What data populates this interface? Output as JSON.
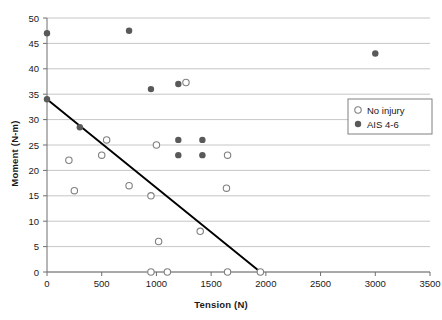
{
  "chart_data": {
    "type": "scatter",
    "title": "",
    "xlabel": "Tension (N)",
    "ylabel": "Moment (N-m)",
    "xlim": [
      0,
      3500
    ],
    "ylim": [
      0,
      50
    ],
    "xticks": [
      0,
      500,
      1000,
      1500,
      2000,
      2500,
      3000,
      3500
    ],
    "yticks": [
      0,
      5,
      10,
      15,
      20,
      25,
      30,
      35,
      40,
      45,
      50
    ],
    "grid": "horizontal",
    "legend_position": "right-upper",
    "series": [
      {
        "name": "No injury",
        "marker": "open-circle",
        "color": "#808080",
        "points": [
          {
            "x": 200,
            "y": 22
          },
          {
            "x": 250,
            "y": 16
          },
          {
            "x": 500,
            "y": 23
          },
          {
            "x": 545,
            "y": 26
          },
          {
            "x": 750,
            "y": 17
          },
          {
            "x": 950,
            "y": 15
          },
          {
            "x": 1000,
            "y": 25
          },
          {
            "x": 1020,
            "y": 6
          },
          {
            "x": 1270,
            "y": 37.3
          },
          {
            "x": 1400,
            "y": 8
          },
          {
            "x": 1640,
            "y": 16.5
          },
          {
            "x": 1650,
            "y": 23
          },
          {
            "x": 950,
            "y": 0
          },
          {
            "x": 1100,
            "y": 0
          },
          {
            "x": 1650,
            "y": 0
          },
          {
            "x": 1950,
            "y": 0
          }
        ]
      },
      {
        "name": "AIS 4-6",
        "marker": "filled-circle",
        "color": "#595959",
        "points": [
          {
            "x": 0,
            "y": 47
          },
          {
            "x": 0,
            "y": 34
          },
          {
            "x": 300,
            "y": 28.5
          },
          {
            "x": 750,
            "y": 47.5
          },
          {
            "x": 950,
            "y": 36
          },
          {
            "x": 1200,
            "y": 37
          },
          {
            "x": 1200,
            "y": 26
          },
          {
            "x": 1200,
            "y": 23
          },
          {
            "x": 1420,
            "y": 26
          },
          {
            "x": 1420,
            "y": 23
          },
          {
            "x": 3000,
            "y": 43
          }
        ]
      }
    ],
    "trendline": {
      "name": "injury-threshold-line",
      "color": "#000000",
      "x0": 0,
      "y0": 34,
      "x1": 1950,
      "y1": 0
    }
  },
  "legend": {
    "entries": [
      {
        "label": "No injury",
        "marker": "open-circle"
      },
      {
        "label": "AIS 4-6",
        "marker": "filled-circle"
      }
    ]
  }
}
